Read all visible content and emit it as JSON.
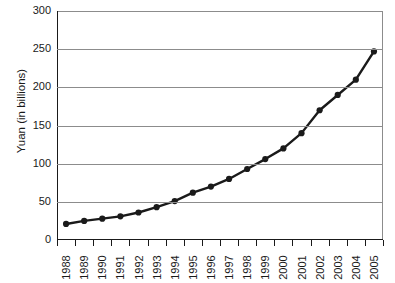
{
  "chart_data": {
    "type": "line",
    "title": "",
    "xlabel": "",
    "ylabel": "Yuan (in billions)",
    "categories": [
      "1988",
      "1989",
      "1990",
      "1991",
      "1992",
      "1993",
      "1994",
      "1995",
      "1996",
      "1997",
      "1998",
      "1999",
      "2000",
      "2001",
      "2002",
      "2003",
      "2004",
      "2005"
    ],
    "values": [
      21,
      25,
      28,
      31,
      36,
      43,
      51,
      62,
      70,
      80,
      93,
      106,
      120,
      140,
      170,
      190,
      210,
      247
    ],
    "series": [
      {
        "name": "Yuan (in billions)",
        "values": [
          21,
          25,
          28,
          31,
          36,
          43,
          51,
          62,
          70,
          80,
          93,
          106,
          120,
          140,
          170,
          190,
          210,
          247
        ]
      }
    ],
    "ylim": [
      0,
      300
    ],
    "yticks": [
      0,
      50,
      100,
      150,
      200,
      250,
      300
    ],
    "ytick_labels": [
      "0",
      "50",
      "100",
      "150",
      "200",
      "250",
      "300"
    ],
    "grid": "horizontal",
    "legend": "none",
    "marker": "filled-circle",
    "line_color": "#1a1a1a",
    "marker_color": "#1a1a1a",
    "grid_color": "#8c8c8c",
    "background": "#ffffff"
  }
}
